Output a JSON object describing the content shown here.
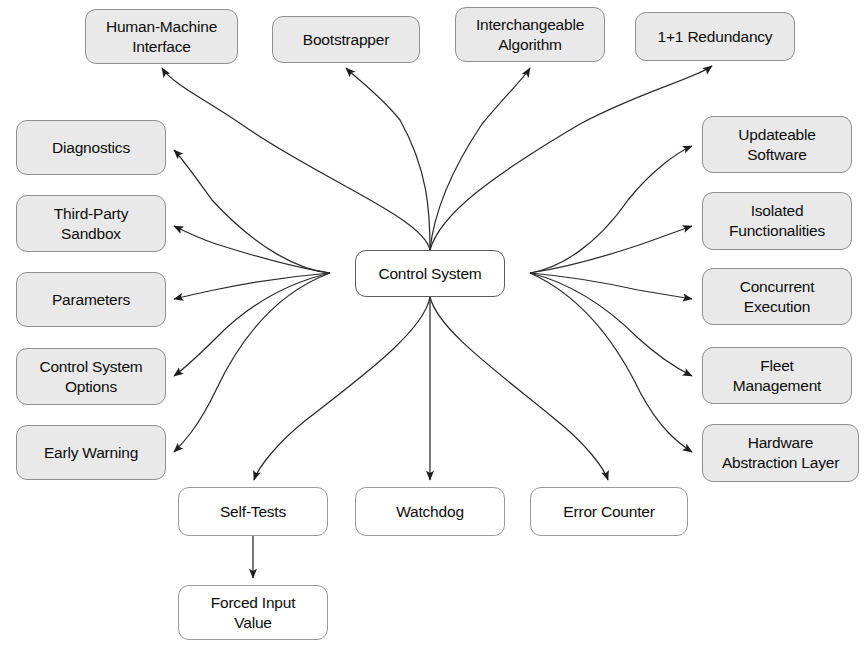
{
  "diagram": {
    "type": "radial-node-graph",
    "canvas": {
      "width": 867,
      "height": 654,
      "background": "#ffffff"
    },
    "styles": {
      "filled_fill": "#e9e9e9",
      "filled_stroke": "#8f8f8f",
      "plain_fill": "#ffffff",
      "plain_stroke": "#9a9a9a",
      "edge_stroke": "#2b2b2b"
    },
    "center": {
      "id": "control-system",
      "label": "Control System",
      "style": "plain",
      "x": 355,
      "y": 250,
      "w": 150,
      "h": 47
    },
    "nodes": [
      {
        "id": "human-machine-interface",
        "label": "Human-Machine\nInterface",
        "style": "filled",
        "x": 85,
        "y": 9,
        "w": 153,
        "h": 55
      },
      {
        "id": "bootstrapper",
        "label": "Bootstrapper",
        "style": "filled",
        "x": 272,
        "y": 16,
        "w": 148,
        "h": 47
      },
      {
        "id": "interchangeable-algorithm",
        "label": "Interchangeable\nAlgorithm",
        "style": "filled",
        "x": 455,
        "y": 7,
        "w": 150,
        "h": 55
      },
      {
        "id": "one-plus-one-redundancy",
        "label": "1+1 Redundancy",
        "style": "filled",
        "x": 635,
        "y": 12,
        "w": 160,
        "h": 49
      },
      {
        "id": "diagnostics",
        "label": "Diagnostics",
        "style": "filled",
        "x": 16,
        "y": 120,
        "w": 150,
        "h": 55
      },
      {
        "id": "third-party-sandbox",
        "label": "Third-Party\nSandbox",
        "style": "filled",
        "x": 16,
        "y": 195,
        "w": 150,
        "h": 57
      },
      {
        "id": "parameters",
        "label": "Parameters",
        "style": "filled",
        "x": 16,
        "y": 272,
        "w": 150,
        "h": 55
      },
      {
        "id": "control-system-options",
        "label": "Control System\nOptions",
        "style": "filled",
        "x": 16,
        "y": 348,
        "w": 150,
        "h": 57
      },
      {
        "id": "early-warning",
        "label": "Early Warning",
        "style": "filled",
        "x": 16,
        "y": 425,
        "w": 150,
        "h": 55
      },
      {
        "id": "updateable-software",
        "label": "Updateable\nSoftware",
        "style": "filled",
        "x": 702,
        "y": 116,
        "w": 150,
        "h": 57
      },
      {
        "id": "isolated-functionalities",
        "label": "Isolated\nFunctionalities",
        "style": "filled",
        "x": 702,
        "y": 192,
        "w": 150,
        "h": 58
      },
      {
        "id": "concurrent-execution",
        "label": "Concurrent\nExecution",
        "style": "filled",
        "x": 702,
        "y": 268,
        "w": 150,
        "h": 57
      },
      {
        "id": "fleet-management",
        "label": "Fleet\nManagement",
        "style": "filled",
        "x": 702,
        "y": 347,
        "w": 150,
        "h": 57
      },
      {
        "id": "hardware-abstraction-layer",
        "label": "Hardware\nAbstraction Layer",
        "style": "filled",
        "x": 702,
        "y": 424,
        "w": 157,
        "h": 58
      },
      {
        "id": "self-tests",
        "label": "Self-Tests",
        "style": "plain",
        "x": 178,
        "y": 487,
        "w": 150,
        "h": 49
      },
      {
        "id": "watchdog",
        "label": "Watchdog",
        "style": "plain",
        "x": 355,
        "y": 487,
        "w": 150,
        "h": 49
      },
      {
        "id": "error-counter",
        "label": "Error Counter",
        "style": "plain",
        "x": 530,
        "y": 487,
        "w": 158,
        "h": 49
      },
      {
        "id": "forced-input-value",
        "label": "Forced Input\nValue",
        "style": "plain",
        "x": 178,
        "y": 585,
        "w": 150,
        "h": 55
      }
    ],
    "edges": [
      {
        "from": "control-system",
        "to": "human-machine-interface",
        "path": "M 430 250 C 424 218 318 178 244 126 C 210 102 172 84 162 68"
      },
      {
        "from": "control-system",
        "to": "bootstrapper",
        "path": "M 430 250 C 430 212 428 170 400 120 C 380 95 356 78 346 68"
      },
      {
        "from": "control-system",
        "to": "interchangeable-algorithm",
        "path": "M 430 250 C 434 212 450 172 482 124 C 505 96 524 78 530 68"
      },
      {
        "from": "control-system",
        "to": "one-plus-one-redundancy",
        "path": "M 430 250 C 440 214 492 176 580 124 C 640 92 696 78 712 66"
      },
      {
        "from": "control-system",
        "to": "diagnostics",
        "path": "M 330 273 C 300 270 258 250 212 200 C 196 178 182 158 174 150"
      },
      {
        "from": "control-system",
        "to": "third-party-sandbox",
        "path": "M 330 273 C 296 268 254 256 216 244 C 198 238 182 230 174 226"
      },
      {
        "from": "control-system",
        "to": "parameters",
        "path": "M 330 273 C 294 276 252 282 214 290 C 196 294 182 297 174 299"
      },
      {
        "from": "control-system",
        "to": "control-system-options",
        "path": "M 330 273 C 292 282 252 302 218 336 C 198 356 182 370 174 376"
      },
      {
        "from": "control-system",
        "to": "early-warning",
        "path": "M 330 273 C 290 288 248 322 216 390 C 198 428 182 444 174 452"
      },
      {
        "from": "control-system",
        "to": "updateable-software",
        "path": "M 530 273 C 560 268 596 246 628 200 C 652 170 678 152 692 146"
      },
      {
        "from": "control-system",
        "to": "isolated-functionalities",
        "path": "M 530 273 C 562 268 600 258 636 246 C 660 238 680 230 692 226"
      },
      {
        "from": "control-system",
        "to": "concurrent-execution",
        "path": "M 530 273 C 564 276 602 282 638 290 C 662 294 680 297 692 299"
      },
      {
        "from": "control-system",
        "to": "fleet-management",
        "path": "M 530 273 C 566 282 604 304 638 338 C 660 358 680 370 692 376"
      },
      {
        "from": "control-system",
        "to": "hardware-abstraction-layer",
        "path": "M 530 273 C 568 290 608 326 640 392 C 660 430 680 444 692 452"
      },
      {
        "from": "control-system",
        "to": "self-tests",
        "path": "M 430 297 C 424 330 368 372 306 420 C 276 444 258 468 254 480"
      },
      {
        "from": "control-system",
        "to": "watchdog",
        "path": "M 430 297 L 430 480"
      },
      {
        "from": "control-system",
        "to": "error-counter",
        "path": "M 430 297 C 438 330 498 372 556 420 C 586 444 604 468 608 480"
      },
      {
        "from": "self-tests",
        "to": "forced-input-value",
        "path": "M 253 536 L 253 578"
      }
    ]
  }
}
